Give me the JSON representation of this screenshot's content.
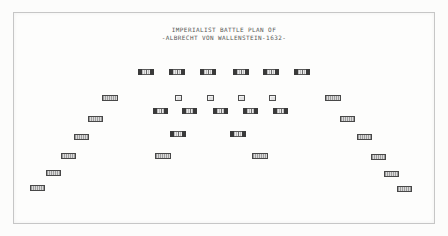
{
  "title": {
    "line1": "IMPERIALIST BATTLE PLAN OF",
    "line2": "-ALBRECHT VON WALLENSTEIN-1632-"
  },
  "colors": {
    "paper": "#fcfcfb",
    "frame_line": "#c6c6c6",
    "ink_dark": "#3a3a3a",
    "hatch_dark": "#9c9c9c",
    "hatch_light": "#dadada",
    "title_text": "#565656"
  },
  "diagram": {
    "frame": {
      "x": 13,
      "y": 12,
      "w": 420,
      "h": 210
    },
    "units": [
      {
        "type": "infantry",
        "x": 138,
        "y": 69,
        "w": 16,
        "h": 6
      },
      {
        "type": "infantry",
        "x": 169,
        "y": 69,
        "w": 16,
        "h": 6
      },
      {
        "type": "infantry",
        "x": 200,
        "y": 69,
        "w": 16,
        "h": 6
      },
      {
        "type": "infantry",
        "x": 233,
        "y": 69,
        "w": 16,
        "h": 6
      },
      {
        "type": "infantry",
        "x": 263,
        "y": 69,
        "w": 16,
        "h": 6
      },
      {
        "type": "infantry",
        "x": 294,
        "y": 69,
        "w": 16,
        "h": 6
      },
      {
        "type": "cavalry",
        "x": 102,
        "y": 95,
        "w": 16,
        "h": 6
      },
      {
        "type": "battery",
        "x": 175,
        "y": 95,
        "w": 7,
        "h": 6
      },
      {
        "type": "battery",
        "x": 207,
        "y": 95,
        "w": 7,
        "h": 6
      },
      {
        "type": "battery",
        "x": 238,
        "y": 95,
        "w": 7,
        "h": 6
      },
      {
        "type": "battery",
        "x": 269,
        "y": 95,
        "w": 7,
        "h": 6
      },
      {
        "type": "cavalry",
        "x": 325,
        "y": 95,
        "w": 16,
        "h": 6
      },
      {
        "type": "infantry",
        "x": 153,
        "y": 108,
        "w": 15,
        "h": 6
      },
      {
        "type": "infantry",
        "x": 182,
        "y": 108,
        "w": 15,
        "h": 6
      },
      {
        "type": "infantry",
        "x": 213,
        "y": 108,
        "w": 15,
        "h": 6
      },
      {
        "type": "infantry",
        "x": 243,
        "y": 108,
        "w": 15,
        "h": 6
      },
      {
        "type": "infantry",
        "x": 273,
        "y": 108,
        "w": 15,
        "h": 6
      },
      {
        "type": "cavalry",
        "x": 88,
        "y": 116,
        "w": 15,
        "h": 6
      },
      {
        "type": "cavalry",
        "x": 340,
        "y": 116,
        "w": 15,
        "h": 6
      },
      {
        "type": "infantry",
        "x": 170,
        "y": 131,
        "w": 16,
        "h": 6
      },
      {
        "type": "infantry",
        "x": 230,
        "y": 131,
        "w": 16,
        "h": 6
      },
      {
        "type": "cavalry",
        "x": 74,
        "y": 134,
        "w": 15,
        "h": 6
      },
      {
        "type": "cavalry",
        "x": 357,
        "y": 134,
        "w": 15,
        "h": 6
      },
      {
        "type": "cavalry",
        "x": 61,
        "y": 153,
        "w": 15,
        "h": 6
      },
      {
        "type": "cavalry",
        "x": 155,
        "y": 153,
        "w": 16,
        "h": 6
      },
      {
        "type": "cavalry",
        "x": 252,
        "y": 153,
        "w": 16,
        "h": 6
      },
      {
        "type": "cavalry",
        "x": 371,
        "y": 154,
        "w": 15,
        "h": 6
      },
      {
        "type": "cavalry",
        "x": 46,
        "y": 170,
        "w": 15,
        "h": 6
      },
      {
        "type": "cavalry",
        "x": 384,
        "y": 171,
        "w": 15,
        "h": 6
      },
      {
        "type": "cavalry",
        "x": 30,
        "y": 185,
        "w": 15,
        "h": 6
      },
      {
        "type": "cavalry",
        "x": 397,
        "y": 186,
        "w": 15,
        "h": 6
      }
    ]
  }
}
